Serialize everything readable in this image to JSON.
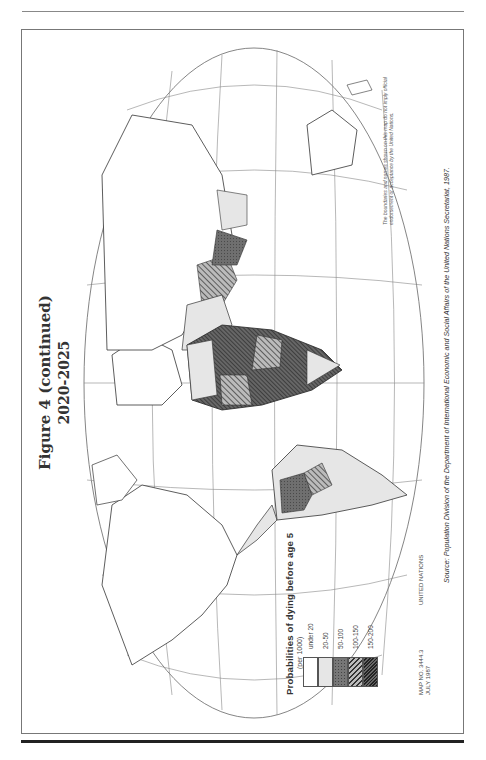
{
  "page": {
    "title": "Figure 4 (continued)",
    "subtitle": "2020-2025",
    "orientation": "rotated 90° counter-clockwise"
  },
  "map": {
    "type": "choropleth world map",
    "projection": "elliptical (Robinson-like)",
    "graticule_labels": [
      "0°",
      "30°",
      "60°",
      "90°",
      "120°",
      "150°",
      "180°"
    ],
    "legend": {
      "title": "Probabilities of dying before age 5",
      "unit": "(per 1000)",
      "items": [
        {
          "label": "under 20",
          "fill": "#ffffff",
          "pattern": "none"
        },
        {
          "label": "20-50",
          "fill": "#e6e6e6",
          "pattern": "none"
        },
        {
          "label": "50-100",
          "fill": "#7a7a7a",
          "pattern": "dots"
        },
        {
          "label": "100-150",
          "fill": "#9a9a9a",
          "pattern": "hatch"
        },
        {
          "label": "150-200",
          "fill": "#555555",
          "pattern": "dense"
        }
      ]
    },
    "map_number": "MAP NO. 3444.3",
    "map_date": "JULY 1987",
    "publisher": "UNITED NATIONS",
    "disclaimer": "The boundaries and names shown on this map do not imply official endorsement or acceptance by the United Nations.",
    "source_label": "Source:",
    "source": "Population Division of the Department of International Economic and Social Affairs of the United Nations Secretariat, 1987."
  }
}
